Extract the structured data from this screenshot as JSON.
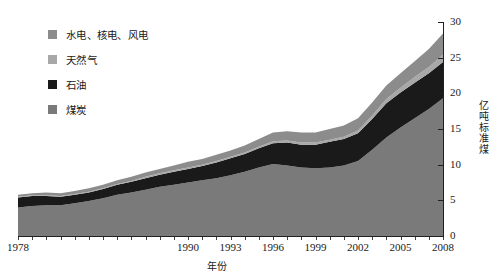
{
  "legend": {
    "items": [
      {
        "label": "水电、核电、风电",
        "color": "#8c8c8c",
        "key": "hydro_nuclear_wind"
      },
      {
        "label": "天然气",
        "color": "#a8a8a8",
        "key": "natural_gas"
      },
      {
        "label": "石油",
        "color": "#1a1a1a",
        "key": "oil"
      },
      {
        "label": "煤炭",
        "color": "#7a7a7a",
        "key": "coal"
      }
    ]
  },
  "axes": {
    "x_title": "年份",
    "y_title": "亿吨标准煤",
    "y_ticks": [
      "0",
      "5",
      "10",
      "15",
      "20",
      "25",
      "30"
    ],
    "x_ticks": [
      "1978",
      "1990",
      "1993",
      "1996",
      "1999",
      "2002",
      "2005",
      "2008"
    ]
  },
  "chart_data": {
    "type": "area",
    "title": "",
    "subtitle": "",
    "xlabel": "年份",
    "ylabel": "亿吨标准煤",
    "xlim": [
      1978,
      2008
    ],
    "ylim": [
      0,
      30
    ],
    "grid": false,
    "stacked": true,
    "legend_position": "top-left",
    "annotations": [],
    "x_tick_labels": [
      "1978",
      "1990",
      "1993",
      "1996",
      "1999",
      "2002",
      "2005",
      "2008"
    ],
    "y_tick_labels": [
      "0",
      "5",
      "10",
      "15",
      "20",
      "25",
      "30"
    ],
    "x": [
      1978,
      1979,
      1980,
      1981,
      1982,
      1983,
      1984,
      1985,
      1986,
      1987,
      1988,
      1989,
      1990,
      1991,
      1992,
      1993,
      1994,
      1995,
      1996,
      1997,
      1998,
      1999,
      2000,
      2001,
      2002,
      2003,
      2004,
      2005,
      2006,
      2007,
      2008
    ],
    "series": [
      {
        "name": "煤炭",
        "color": "#7a7a7a",
        "values": [
          4.0,
          4.2,
          4.3,
          4.3,
          4.6,
          4.9,
          5.3,
          5.8,
          6.1,
          6.5,
          6.9,
          7.2,
          7.5,
          7.8,
          8.1,
          8.5,
          9.0,
          9.6,
          10.1,
          9.9,
          9.6,
          9.5,
          9.6,
          9.9,
          10.5,
          12.1,
          13.8,
          15.2,
          16.5,
          17.8,
          19.3
        ],
        "units": "亿吨标准煤"
      },
      {
        "name": "石油",
        "color": "#1a1a1a",
        "values": [
          1.4,
          1.4,
          1.3,
          1.2,
          1.2,
          1.2,
          1.3,
          1.4,
          1.5,
          1.6,
          1.7,
          1.8,
          1.9,
          2.0,
          2.2,
          2.4,
          2.5,
          2.7,
          2.9,
          3.2,
          3.2,
          3.3,
          3.6,
          3.7,
          3.9,
          4.3,
          4.8,
          4.9,
          5.0,
          5.0,
          5.1
        ],
        "units": "亿吨标准煤"
      },
      {
        "name": "天然气",
        "color": "#a8a8a8",
        "values": [
          0.1,
          0.1,
          0.1,
          0.1,
          0.1,
          0.1,
          0.1,
          0.1,
          0.1,
          0.2,
          0.2,
          0.2,
          0.2,
          0.2,
          0.2,
          0.2,
          0.2,
          0.2,
          0.3,
          0.3,
          0.3,
          0.3,
          0.3,
          0.3,
          0.4,
          0.5,
          0.6,
          0.7,
          0.8,
          0.9,
          1.0
        ],
        "units": "亿吨标准煤"
      },
      {
        "name": "水电、核电、风电",
        "color": "#8c8c8c",
        "values": [
          0.3,
          0.3,
          0.4,
          0.4,
          0.4,
          0.5,
          0.5,
          0.5,
          0.6,
          0.6,
          0.6,
          0.7,
          0.8,
          0.8,
          0.9,
          0.9,
          1.0,
          1.1,
          1.2,
          1.3,
          1.4,
          1.4,
          1.5,
          1.6,
          1.7,
          1.8,
          1.9,
          2.0,
          2.2,
          2.5,
          3.0
        ],
        "units": "亿吨标准煤"
      }
    ],
    "totals": [
      5.8,
      6.0,
      6.1,
      6.0,
      6.3,
      6.7,
      7.2,
      7.8,
      8.3,
      8.9,
      9.4,
      9.9,
      10.4,
      10.8,
      11.4,
      12.0,
      12.7,
      13.6,
      14.5,
      14.7,
      14.5,
      14.5,
      15.0,
      15.5,
      16.5,
      18.7,
      21.1,
      22.8,
      24.5,
      26.2,
      28.4
    ]
  }
}
